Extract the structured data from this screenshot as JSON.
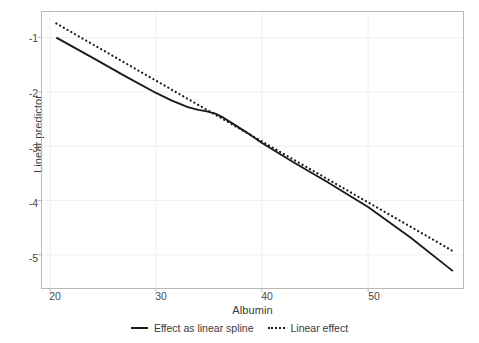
{
  "chart_data": {
    "type": "line",
    "title": "",
    "xlabel": "Albumin",
    "ylabel": "Linear predictor",
    "xlim": [
      19.2,
      59.0
    ],
    "ylim": [
      -5.62,
      -0.52
    ],
    "xticks": [
      20,
      30,
      40,
      50
    ],
    "xtick_labels": [
      "20",
      "30",
      "40",
      "50"
    ],
    "yticks": [
      -1,
      -2,
      -3,
      -4,
      -5
    ],
    "ytick_labels": [
      "-1",
      "-2",
      "-3",
      "-4",
      "-5"
    ],
    "grid": true,
    "legend_position": "bottom",
    "series": [
      {
        "name": "Effect as linear spline",
        "style": "solid",
        "color": "#1a1a1a",
        "x": [
          20.6,
          24.0,
          27.0,
          30.0,
          31.5,
          33.0,
          34.0,
          34.8,
          35.6,
          36.4,
          37.2,
          38.5,
          40.0,
          43.0,
          46.0,
          50.0,
          54.0,
          58.0
        ],
        "y": [
          -1.0,
          -1.37,
          -1.7,
          -2.02,
          -2.16,
          -2.28,
          -2.33,
          -2.36,
          -2.4,
          -2.48,
          -2.58,
          -2.74,
          -2.94,
          -3.3,
          -3.64,
          -4.12,
          -4.68,
          -5.3
        ]
      },
      {
        "name": "Linear effect",
        "style": "dotted",
        "color": "#1a1a1a",
        "x": [
          20.6,
          58.0
        ],
        "y": [
          -0.74,
          -4.93
        ]
      }
    ],
    "legend": [
      {
        "label": "Effect as linear spline",
        "style": "solid"
      },
      {
        "label": "Linear effect",
        "style": "dotted"
      }
    ],
    "axis_frame_color": "#b9b9b9",
    "grid_color": "#f0f0f0"
  }
}
